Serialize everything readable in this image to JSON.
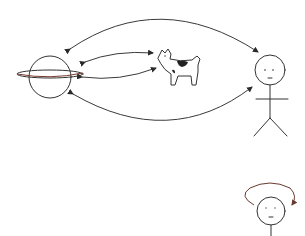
{
  "diagram": {
    "title": "Relationships between planet, dog, and person",
    "nodes": [
      {
        "id": "planet",
        "label": "planet (ringed, Saturn-like)",
        "icon": "planet-icon"
      },
      {
        "id": "dog",
        "label": "dog",
        "icon": "dog-icon"
      },
      {
        "id": "person",
        "label": "stick figure person",
        "icon": "stick-figure-icon"
      },
      {
        "id": "self",
        "label": "person (self-reference)",
        "icon": "face-icon"
      }
    ],
    "edges": [
      {
        "from": "planet",
        "to": "person",
        "type": "bidirectional",
        "route": "top arc"
      },
      {
        "from": "planet",
        "to": "dog",
        "type": "bidirectional",
        "route": "upper"
      },
      {
        "from": "planet",
        "to": "dog",
        "type": "bidirectional",
        "route": "lower"
      },
      {
        "from": "planet",
        "to": "person",
        "type": "bidirectional",
        "route": "bottom arc"
      },
      {
        "from": "self",
        "to": "self",
        "type": "self-loop",
        "route": "above head"
      }
    ],
    "colors": {
      "ink": "#333333",
      "self_loop": "#8a4a3a",
      "dog_spot": "#222222",
      "background": "#ffffff"
    }
  }
}
